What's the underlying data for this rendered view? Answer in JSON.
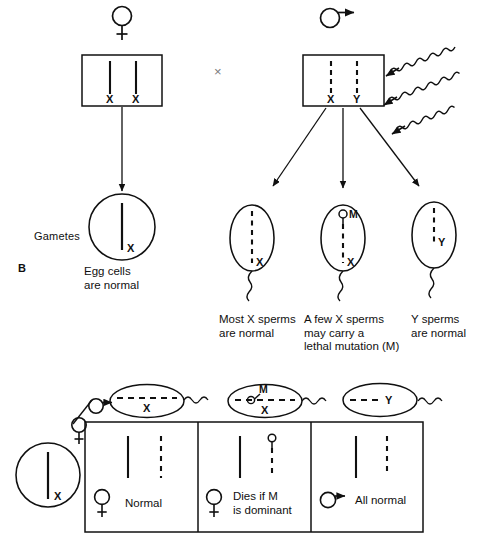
{
  "figure": {
    "section_letter": "B",
    "cross_symbol": "×",
    "gametes_label": "Gametes"
  },
  "parents": {
    "female": {
      "symbol_name": "female-symbol",
      "chromosomes": [
        {
          "letter": "X",
          "style": "solid"
        },
        {
          "letter": "X",
          "style": "solid"
        }
      ]
    },
    "male": {
      "symbol_name": "male-symbol",
      "chromosomes": [
        {
          "letter": "X",
          "style": "dashed"
        },
        {
          "letter": "Y",
          "style": "dashed"
        }
      ],
      "irradiation": {
        "name": "radiation-waves",
        "count": 3
      }
    }
  },
  "gametes": {
    "egg": {
      "chromosome": {
        "letter": "X",
        "style": "solid"
      },
      "caption": "Egg cells\nare normal"
    },
    "sperms": [
      {
        "chromosome": {
          "letter": "X",
          "style": "dashed"
        },
        "mutation": null,
        "caption": "Most X sperms\nare normal"
      },
      {
        "chromosome": {
          "letter": "X",
          "style": "dashed"
        },
        "mutation": {
          "letter": "M",
          "name": "lethal-mutation-marker"
        },
        "caption": "A few X sperms\nmay carry a\nlethal mutation (M)"
      },
      {
        "chromosome": {
          "letter": "Y",
          "style": "dashed"
        },
        "mutation": null,
        "caption": "Y sperms\nare normal"
      }
    ]
  },
  "cross_table": {
    "row_header": {
      "symbol_name": "female-symbol",
      "egg_chromosome": {
        "letter": "X",
        "style": "solid"
      }
    },
    "column_header": {
      "symbol_name": "male-symbol",
      "sperms": [
        {
          "letter": "X",
          "style": "dashed",
          "mutation": null
        },
        {
          "letter": "X",
          "style": "dashed",
          "mutation": {
            "letter": "M"
          }
        },
        {
          "letter": "Y",
          "style": "dashed",
          "mutation": null
        }
      ]
    },
    "cells": [
      {
        "chromosomes": [
          {
            "style": "solid"
          },
          {
            "style": "dashed",
            "mutation": false
          }
        ],
        "offspring_symbol": "female-symbol",
        "outcome": "Normal"
      },
      {
        "chromosomes": [
          {
            "style": "solid"
          },
          {
            "style": "dashed",
            "mutation": true
          }
        ],
        "offspring_symbol": "female-symbol",
        "outcome": "Dies if M\nis dominant"
      },
      {
        "chromosomes": [
          {
            "style": "solid"
          },
          {
            "style": "dashed",
            "mutation": false
          }
        ],
        "offspring_symbol": "male-symbol",
        "outcome": "All normal"
      }
    ]
  },
  "colors": {
    "ink": "#101010",
    "paper": "#ffffff",
    "faint": "#7a7a7a"
  }
}
